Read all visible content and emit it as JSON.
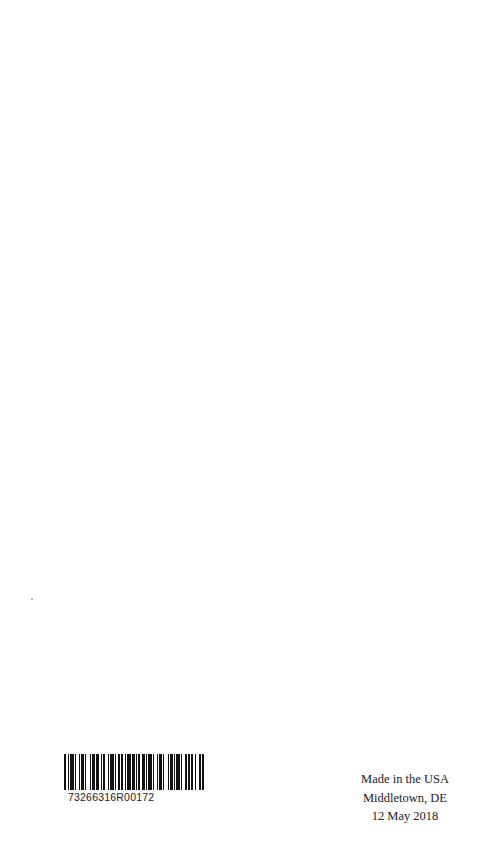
{
  "page": {
    "background": "#ffffff"
  },
  "barcode": {
    "number": "73266316R00172",
    "bars": [
      2,
      1,
      1,
      1,
      3,
      1,
      1,
      2,
      1,
      1,
      2,
      1,
      1,
      3,
      1,
      1,
      2,
      1,
      3,
      1,
      1,
      1,
      2,
      2,
      1,
      1,
      3,
      1,
      1,
      1,
      2,
      1,
      1,
      2,
      1,
      1,
      3,
      1,
      2,
      1,
      1,
      1,
      1,
      2,
      2,
      1,
      1,
      1,
      3,
      1,
      1,
      2,
      1,
      1,
      2,
      1,
      1,
      3,
      1,
      1,
      2,
      1,
      1,
      1,
      3,
      1,
      1,
      2,
      2,
      1,
      1,
      1,
      2,
      1,
      1,
      3,
      1,
      1,
      2,
      1
    ]
  },
  "imprint": {
    "line1": "Made in the USA",
    "line2": "Middletown, DE",
    "line3": "12 May 2018"
  }
}
